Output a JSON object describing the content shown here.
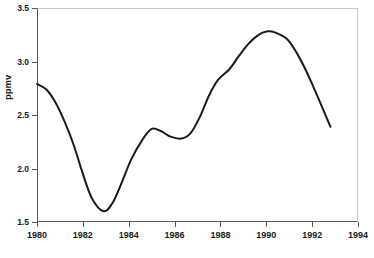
{
  "chart_data": {
    "type": "line",
    "title": "",
    "xlabel": "",
    "ylabel": "ppmv",
    "xlim": [
      1980,
      1994
    ],
    "ylim": [
      1.5,
      3.5
    ],
    "xticks": [
      1980,
      1982,
      1984,
      1986,
      1988,
      1990,
      1992,
      1994
    ],
    "yticks": [
      1.5,
      2.0,
      2.5,
      3.0,
      3.5
    ],
    "ytick_labels": [
      "1.5",
      "2.0",
      "2.5",
      "3.0",
      "3.5"
    ],
    "xtick_labels": [
      "1980",
      "1982",
      "1984",
      "1986",
      "1988",
      "1990",
      "1992",
      "1994"
    ],
    "grid": false,
    "legend": null,
    "series": [
      {
        "name": "ppmv",
        "color": "#1a1a1a",
        "line_width": 2,
        "x": [
          1980.0,
          1980.4,
          1980.8,
          1981.2,
          1981.6,
          1982.0,
          1982.4,
          1982.9,
          1983.3,
          1983.7,
          1984.1,
          1984.6,
          1985.0,
          1985.4,
          1985.8,
          1986.3,
          1986.7,
          1987.1,
          1987.5,
          1987.9,
          1988.4,
          1988.8,
          1989.2,
          1989.6,
          1990.0,
          1990.4,
          1990.9,
          1991.3,
          1991.7,
          1992.1,
          1992.5,
          1992.8
        ],
        "y": [
          2.79,
          2.74,
          2.62,
          2.44,
          2.22,
          1.95,
          1.72,
          1.6,
          1.68,
          1.87,
          2.08,
          2.27,
          2.37,
          2.35,
          2.3,
          2.28,
          2.33,
          2.48,
          2.68,
          2.83,
          2.93,
          3.05,
          3.16,
          3.24,
          3.28,
          3.27,
          3.21,
          3.09,
          2.93,
          2.74,
          2.54,
          2.39
        ]
      }
    ],
    "annotations": []
  },
  "axis": {
    "y_title": "ppmv"
  }
}
